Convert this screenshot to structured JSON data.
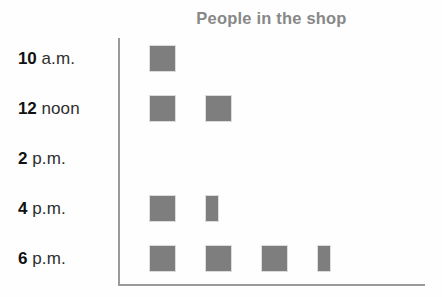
{
  "chart": {
    "title": "People in the shop"
  },
  "chart_data": {
    "type": "pictogram",
    "title": "People in the shop",
    "xlabel": "",
    "ylabel": "",
    "orientation": "horizontal",
    "symbol": "square",
    "symbol_color": "#7e7e7e",
    "axis_color": "#9a9a9a",
    "title_color": "#888888",
    "grid": false,
    "legend": null,
    "categories": [
      "10 a.m.",
      "12 noon",
      "2 p.m.",
      "4 p.m.",
      "6 p.m."
    ],
    "values": [
      1,
      2,
      0,
      1.5,
      3.5
    ],
    "rows": [
      {
        "num": "10",
        "suffix": "a.m.",
        "label": "10 a.m.",
        "value": 1,
        "symbols": [
          "full"
        ]
      },
      {
        "num": "12",
        "suffix": "noon",
        "label": "12 noon",
        "value": 2,
        "symbols": [
          "full",
          "full"
        ]
      },
      {
        "num": "2",
        "suffix": "p.m.",
        "label": "2 p.m.",
        "value": 0,
        "symbols": []
      },
      {
        "num": "4",
        "suffix": "p.m.",
        "label": "4 p.m.",
        "value": 1.5,
        "symbols": [
          "full",
          "half"
        ]
      },
      {
        "num": "6",
        "suffix": "p.m.",
        "label": "6 p.m.",
        "value": 3.5,
        "symbols": [
          "full",
          "full",
          "full",
          "half"
        ]
      }
    ]
  }
}
